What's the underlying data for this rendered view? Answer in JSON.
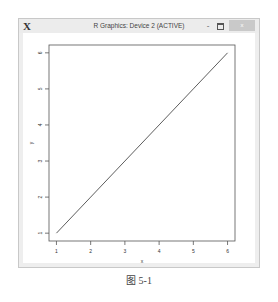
{
  "window": {
    "title": "R Graphics: Device 2 (ACTIVE)",
    "app_icon": "X",
    "minimize_label": "-",
    "close_label": "x"
  },
  "caption": "图 5-1",
  "chart_data": {
    "type": "line",
    "title": "",
    "xlabel": "x",
    "ylabel": "y",
    "x": [
      1,
      2,
      3,
      4,
      5,
      6
    ],
    "series": [
      {
        "name": "y",
        "values": [
          1,
          2,
          3,
          4,
          5,
          6
        ]
      }
    ],
    "xticks": [
      "1",
      "2",
      "3",
      "4",
      "5",
      "6"
    ],
    "yticks": [
      "1",
      "2",
      "3",
      "4",
      "5",
      "6"
    ],
    "xlim": [
      1,
      6
    ],
    "ylim": [
      1,
      6
    ],
    "grid": false,
    "legend": null
  },
  "colors": {
    "line": "#333333",
    "axis": "#555555",
    "titlebar": "#ececec",
    "close_button": "#c9c9c9"
  }
}
